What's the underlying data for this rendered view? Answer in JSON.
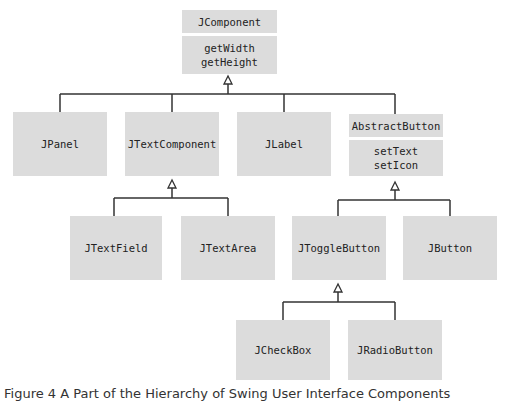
{
  "classes": {
    "jcomponent": {
      "name": "JComponent",
      "methods": [
        "getWidth",
        "getHeight"
      ]
    },
    "jpanel": {
      "name": "JPanel"
    },
    "jtextcomponent": {
      "name": "JTextComponent"
    },
    "jlabel": {
      "name": "JLabel"
    },
    "abstractbutton": {
      "name": "AbstractButton",
      "methods": [
        "setText",
        "setIcon"
      ]
    },
    "jtextfield": {
      "name": "JTextField"
    },
    "jtextarea": {
      "name": "JTextArea"
    },
    "jtogglebutton": {
      "name": "JToggleButton"
    },
    "jbutton": {
      "name": "JButton"
    },
    "jcheckbox": {
      "name": "JCheckBox"
    },
    "jradiobutton": {
      "name": "JRadioButton"
    }
  },
  "caption": "Figure 4  A Part of the Hierarchy of Swing User Interface Components",
  "colors": {
    "box": "#dcdcdc",
    "line": "#333333"
  }
}
